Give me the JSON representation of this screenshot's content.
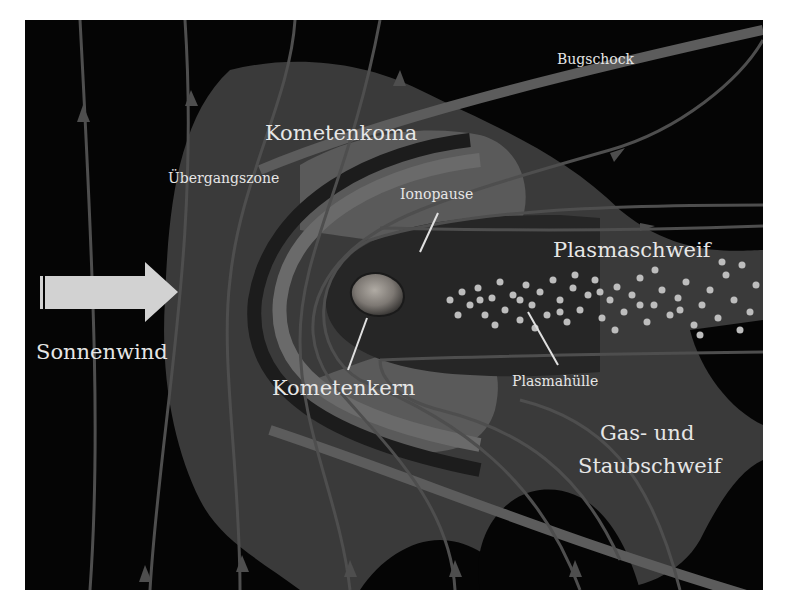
{
  "diagram": {
    "colors": {
      "background": "#ffffff",
      "space": "#050505",
      "transition_zone": "#3a3a3a",
      "coma": "#5a5a5a",
      "inner_cavity": "#262626",
      "field_lines": "#4e4e4e",
      "bow_shock_band": "#5c5c5c",
      "plasma_dots": "#bdbdbd",
      "solar_wind_arrow": "#d2d2d2",
      "label_text": "#e6e6e6",
      "nucleus": "#8a8580"
    },
    "labels": {
      "bugschock": "Bugschock",
      "kometenkoma": "Kometenkoma",
      "uebergangszone": "Übergangszone",
      "ionopause": "Ionopause",
      "plasmaschweif": "Plasmaschweif",
      "sonnenwind": "Sonnenwind",
      "kometenkern": "Kometenkern",
      "plasmahuelle": "Plasmahülle",
      "gas_staub_line1": "Gas- und",
      "gas_staub_line2": "Staubschweif"
    },
    "elements": [
      {
        "id": "sonnenwind-arrow",
        "kind": "arrow",
        "direction": "right",
        "label": "Sonnenwind"
      },
      {
        "id": "comet-nucleus",
        "kind": "body",
        "label": "Kometenkern"
      },
      {
        "id": "ionopause",
        "kind": "boundary",
        "label": "Ionopause"
      },
      {
        "id": "coma",
        "kind": "region",
        "label": "Kometenkoma"
      },
      {
        "id": "transition-zone",
        "kind": "region",
        "label": "Übergangszone"
      },
      {
        "id": "bow-shock",
        "kind": "band",
        "label": "Bugschock"
      },
      {
        "id": "plasma-tail",
        "kind": "particle-stream",
        "label": "Plasmaschweif"
      },
      {
        "id": "plasma-sheath",
        "kind": "region",
        "label": "Plasmahülle"
      },
      {
        "id": "gas-dust-tail",
        "kind": "region",
        "label": "Gas- und Staubschweif"
      },
      {
        "id": "magnetic-field-lines",
        "kind": "flow-lines",
        "label": ""
      }
    ]
  }
}
